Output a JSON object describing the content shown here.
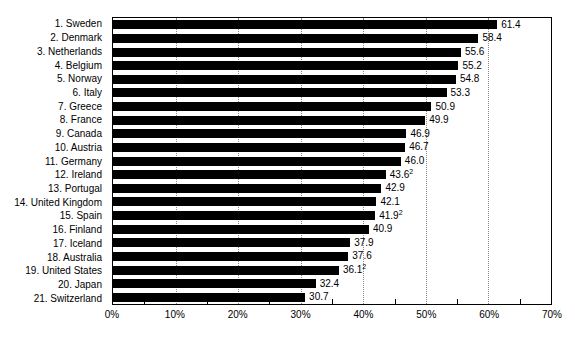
{
  "chart_data": {
    "type": "bar",
    "orientation": "horizontal",
    "title": "",
    "xlabel": "",
    "ylabel": "",
    "xlim": [
      0,
      70
    ],
    "grid": "vertical-dotted",
    "legend_position": "none",
    "x_ticks": [
      {
        "value": 0,
        "label": "0%"
      },
      {
        "value": 10,
        "label": "10%"
      },
      {
        "value": 20,
        "label": "20%"
      },
      {
        "value": 30,
        "label": "30%"
      },
      {
        "value": 40,
        "label": "40%"
      },
      {
        "value": 50,
        "label": "50%"
      },
      {
        "value": 60,
        "label": "60%"
      },
      {
        "value": 70,
        "label": "70%"
      }
    ],
    "gridline_values": [
      10,
      20,
      30,
      40,
      50,
      60
    ],
    "minor_tick_values": [
      5,
      15,
      25,
      35,
      45,
      55,
      65
    ],
    "bars": [
      {
        "label": "1. Sweden",
        "value": 61.4,
        "display": "61.4",
        "footnote": ""
      },
      {
        "label": "2. Denmark",
        "value": 58.4,
        "display": "58.4",
        "footnote": ""
      },
      {
        "label": "3. Netherlands",
        "value": 55.6,
        "display": "55.6",
        "footnote": ""
      },
      {
        "label": "4. Belgium",
        "value": 55.2,
        "display": "55.2",
        "footnote": ""
      },
      {
        "label": "5. Norway",
        "value": 54.8,
        "display": "54.8",
        "footnote": ""
      },
      {
        "label": "6. Italy",
        "value": 53.3,
        "display": "53.3",
        "footnote": ""
      },
      {
        "label": "7. Greece",
        "value": 50.9,
        "display": "50.9",
        "footnote": ""
      },
      {
        "label": "8. France",
        "value": 49.9,
        "display": "49.9",
        "footnote": ""
      },
      {
        "label": "9. Canada",
        "value": 46.9,
        "display": "46.9",
        "footnote": ""
      },
      {
        "label": "10. Austria",
        "value": 46.7,
        "display": "46.7",
        "footnote": ""
      },
      {
        "label": "11. Germany",
        "value": 46.0,
        "display": "46.0",
        "footnote": ""
      },
      {
        "label": "12. Ireland",
        "value": 43.6,
        "display": "43.6",
        "footnote": "2"
      },
      {
        "label": "13. Portugal",
        "value": 42.9,
        "display": "42.9",
        "footnote": ""
      },
      {
        "label": "14. United Kingdom",
        "value": 42.1,
        "display": "42.1",
        "footnote": ""
      },
      {
        "label": "15. Spain",
        "value": 41.9,
        "display": "41.9",
        "footnote": "2"
      },
      {
        "label": "16. Finland",
        "value": 40.9,
        "display": "40.9",
        "footnote": ""
      },
      {
        "label": "17. Iceland",
        "value": 37.9,
        "display": "37.9",
        "footnote": ""
      },
      {
        "label": "18. Australia",
        "value": 37.6,
        "display": "37.6",
        "footnote": ""
      },
      {
        "label": "19. United States",
        "value": 36.1,
        "display": "36.1",
        "footnote": "2"
      },
      {
        "label": "20. Japan",
        "value": 32.4,
        "display": "32.4",
        "footnote": ""
      },
      {
        "label": "21. Switzerland",
        "value": 30.7,
        "display": "30.7",
        "footnote": ""
      }
    ]
  },
  "colors": {
    "bar": "#000000",
    "text": "#000000",
    "gridline": "#8a8a8a",
    "plot_border": "#000000",
    "background": "#ffffff"
  }
}
